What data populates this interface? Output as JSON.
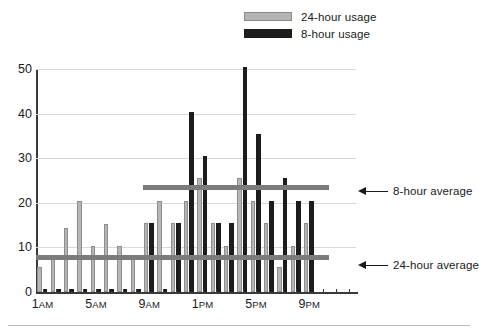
{
  "legend": {
    "position": "top-center",
    "items": [
      {
        "label": "24-hour usage",
        "color": "#b6b6b6",
        "swatch": "grey-swatch"
      },
      {
        "label": "8-hour usage",
        "color": "#1c1c1c",
        "swatch": "black-swatch"
      }
    ]
  },
  "annotations": [
    {
      "label": "8-hour average",
      "value": 23.5,
      "icon": "left-arrow-icon"
    },
    {
      "label": "24-hour average",
      "value": 7.7,
      "icon": "left-arrow-icon"
    }
  ],
  "axis": {
    "y_ticks": [
      "0",
      "10",
      "20",
      "30",
      "40",
      "50"
    ],
    "x_ticks": [
      {
        "label": "1",
        "suffix": "AM",
        "index": 0
      },
      {
        "label": "5",
        "suffix": "AM",
        "index": 4
      },
      {
        "label": "9",
        "suffix": "AM",
        "index": 8
      },
      {
        "label": "1",
        "suffix": "PM",
        "index": 12
      },
      {
        "label": "5",
        "suffix": "PM",
        "index": 16
      },
      {
        "label": "9",
        "suffix": "PM",
        "index": 20
      }
    ]
  },
  "chart_data": {
    "type": "bar",
    "title": "",
    "subtitle": "",
    "xlabel": "",
    "ylabel": "",
    "ylim": [
      0,
      50
    ],
    "ytick_interval": 10,
    "grid": true,
    "legend_position": "top-center",
    "categories": [
      "1AM",
      "2AM",
      "3AM",
      "4AM",
      "5AM",
      "6AM",
      "7AM",
      "8AM",
      "9AM",
      "10AM",
      "11AM",
      "12PM",
      "1PM",
      "2PM",
      "3PM",
      "4PM",
      "5PM",
      "6PM",
      "7PM",
      "8PM",
      "9PM",
      "10PM",
      "11PM",
      "12AM"
    ],
    "series": [
      {
        "name": "24-hour usage",
        "color": "#b6b6b6",
        "values": [
          5.5,
          8.2,
          14.3,
          20.4,
          10.3,
          15.3,
          10.3,
          8.3,
          15.4,
          20.4,
          15.4,
          20.4,
          25.5,
          15.4,
          10.3,
          25.5,
          20.4,
          15.4,
          5.6,
          10.3,
          15.4,
          0,
          0,
          0
        ]
      },
      {
        "name": "8-hour usage",
        "color": "#1c1c1c",
        "values": [
          0.7,
          0.7,
          0.7,
          0.7,
          0.7,
          0.7,
          0.7,
          0.7,
          15.4,
          0.7,
          15.4,
          40.3,
          30.4,
          15.4,
          15.4,
          50.5,
          35.4,
          20.4,
          25.6,
          20.4,
          20.4,
          0,
          0,
          0
        ]
      }
    ],
    "reference_lines": [
      {
        "name": "8-hour average",
        "value": 23.5,
        "color": "#7b7b7b",
        "start_index": 8,
        "end_index": 21
      },
      {
        "name": "24-hour average",
        "value": 7.7,
        "color": "#7b7b7b",
        "start_index": 0,
        "end_index": 21
      }
    ]
  }
}
